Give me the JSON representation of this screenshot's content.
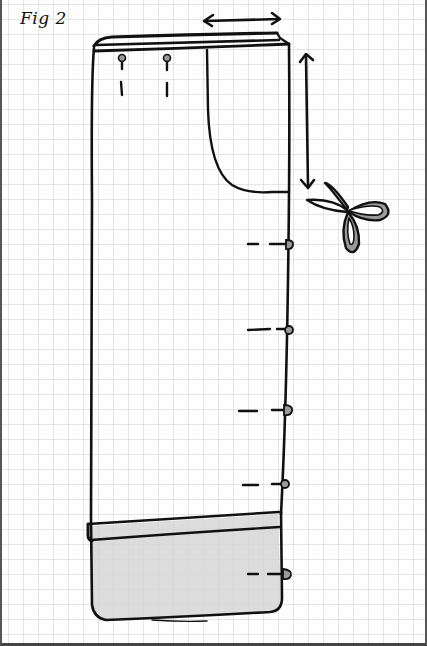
{
  "figure": {
    "label": "Fig 2",
    "type": "sewing pattern illustration on graph paper",
    "colors": {
      "ink": "#111111",
      "shade": "#d6d6d6",
      "scissors_fill": "#9a9a9a",
      "grid": "#c8c8c8",
      "paper": "#fefefe"
    },
    "annotations": [
      {
        "name": "waist-width-arrow",
        "kind": "double-arrow-horizontal"
      },
      {
        "name": "pocket-depth-arrow",
        "kind": "double-arrow-vertical"
      },
      {
        "name": "scissors",
        "kind": "cut-mark"
      },
      {
        "name": "pins",
        "count": 5,
        "kind": "pin-marks-side-seam"
      },
      {
        "name": "waist-pins",
        "count": 2,
        "kind": "pin-marks-waistband"
      },
      {
        "name": "hem-band",
        "kind": "shaded-fold"
      }
    ]
  }
}
